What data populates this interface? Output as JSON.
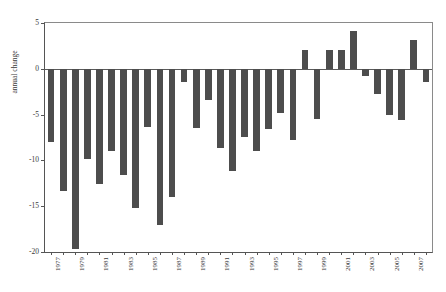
{
  "top_caption": "",
  "chart_data": {
    "type": "bar",
    "title": "",
    "xlabel": "",
    "ylabel": "annual change",
    "ylim": [
      -20,
      5
    ],
    "yticks": [
      5,
      0,
      -5,
      -10,
      -15,
      -20
    ],
    "ytick_labels": [
      "5",
      "0",
      "-5",
      "-10",
      "-15",
      "-20"
    ],
    "grid": false,
    "legend": "none",
    "bar_color": "#4d4d4d",
    "axis_color": "#555555",
    "categories": [
      "1977",
      "1978",
      "1979",
      "1980",
      "1981",
      "1982",
      "1983",
      "1984",
      "1985",
      "1986",
      "1987",
      "1988",
      "1989",
      "1990",
      "1991",
      "1992",
      "1993",
      "1994",
      "1995",
      "1996",
      "1997",
      "1998",
      "1999",
      "2000",
      "2001",
      "2002",
      "2003",
      "2004",
      "2005",
      "2006",
      "2007",
      "2008"
    ],
    "tick_labels_shown": [
      "1977",
      "1979",
      "1981",
      "1983",
      "1985",
      "1987",
      "1989",
      "1991",
      "1993",
      "1995",
      "1997",
      "1999",
      "2001",
      "2003",
      "2005",
      "2007"
    ],
    "values": [
      -8.0,
      -13.3,
      -19.7,
      -9.8,
      -12.6,
      -9.0,
      -11.6,
      -15.2,
      -6.3,
      -17.0,
      -14.0,
      -1.4,
      -6.5,
      -3.4,
      -8.6,
      -11.2,
      -7.4,
      -9.0,
      -6.6,
      -4.8,
      -7.8,
      2.0,
      -5.5,
      2.0,
      2.1,
      4.1,
      -0.8,
      -2.8,
      -5.0,
      -5.6,
      3.1,
      -1.4
    ]
  }
}
